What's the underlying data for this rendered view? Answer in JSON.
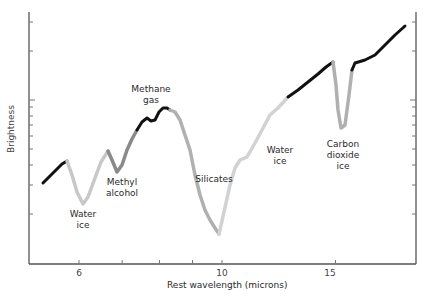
{
  "chart_data": {
    "type": "line",
    "title": "",
    "xlabel": "Rest wavelength (microns)",
    "ylabel": "Brightness",
    "x_scale": "log",
    "y_scale": "log",
    "xlim": [
      5.2,
      19.5
    ],
    "x_ticks": [
      6,
      7,
      8,
      9,
      10,
      15
    ],
    "x_tick_labels": [
      "6",
      "",
      "",
      "",
      "10",
      "15"
    ],
    "grid": false,
    "legend": null,
    "series": [
      {
        "name": "Spectrum",
        "points_px": [
          [
            43,
            183
          ],
          [
            50,
            176
          ],
          [
            56,
            170
          ],
          [
            62,
            164
          ],
          [
            67,
            161
          ],
          [
            72,
            175
          ],
          [
            77,
            192
          ],
          [
            83,
            204
          ],
          [
            88,
            197
          ],
          [
            95,
            178
          ],
          [
            101,
            162
          ],
          [
            108,
            151
          ],
          [
            112,
            160
          ],
          [
            117,
            172
          ],
          [
            122,
            165
          ],
          [
            127,
            150
          ],
          [
            132,
            139
          ],
          [
            137,
            130
          ],
          [
            142,
            122
          ],
          [
            147,
            118
          ],
          [
            151,
            121
          ],
          [
            155,
            120
          ],
          [
            159,
            112
          ],
          [
            163,
            108
          ],
          [
            167,
            108
          ],
          [
            170,
            110
          ],
          [
            175,
            112
          ],
          [
            180,
            120
          ],
          [
            185,
            135
          ],
          [
            190,
            150
          ],
          [
            195,
            175
          ],
          [
            200,
            195
          ],
          [
            205,
            210
          ],
          [
            210,
            220
          ],
          [
            215,
            228
          ],
          [
            219,
            234
          ],
          [
            224,
            212
          ],
          [
            230,
            185
          ],
          [
            235,
            168
          ],
          [
            240,
            160
          ],
          [
            247,
            157
          ],
          [
            255,
            143
          ],
          [
            262,
            130
          ],
          [
            270,
            115
          ],
          [
            278,
            108
          ],
          [
            288,
            97
          ],
          [
            298,
            90
          ],
          [
            308,
            82
          ],
          [
            318,
            74
          ],
          [
            326,
            67
          ],
          [
            333,
            62
          ],
          [
            336,
            85
          ],
          [
            338,
            110
          ],
          [
            341,
            128
          ],
          [
            345,
            125
          ],
          [
            349,
            95
          ],
          [
            352,
            70
          ],
          [
            355,
            63
          ],
          [
            365,
            60
          ],
          [
            375,
            55
          ],
          [
            385,
            45
          ],
          [
            395,
            35
          ],
          [
            405,
            26
          ],
          [
            411,
            20
          ]
        ],
        "segments": [
          {
            "from": 0,
            "to": 4,
            "color": "#111111",
            "feature": ""
          },
          {
            "from": 4,
            "to": 11,
            "color": "#c8c8c8",
            "feature": "Water ice"
          },
          {
            "from": 11,
            "to": 17,
            "color": "#8a8a8a",
            "feature": "Methyl alcohol"
          },
          {
            "from": 17,
            "to": 25,
            "color": "#111111",
            "feature": "Methane gas"
          },
          {
            "from": 25,
            "to": 35,
            "color": "#b0b0b0",
            "feature": "Silicates"
          },
          {
            "from": 35,
            "to": 45,
            "color": "#d2d2d2",
            "feature": "Water ice"
          },
          {
            "from": 45,
            "to": 50,
            "color": "#111111",
            "feature": ""
          },
          {
            "from": 50,
            "to": 56,
            "color": "#b0b0b0",
            "feature": "Carbon dioxide ice"
          },
          {
            "from": 56,
            "to": 62,
            "color": "#111111",
            "feature": ""
          }
        ]
      }
    ],
    "annotations": [
      {
        "text": "Water\nice",
        "x_px": 83,
        "y_px": 215
      },
      {
        "text": "Methyl\nalcohol",
        "x_px": 121,
        "y_px": 181
      },
      {
        "text": "Methane\ngas",
        "x_px": 148,
        "y_px": 85
      },
      {
        "text": "Silicates",
        "x_px": 213,
        "y_px": 177
      },
      {
        "text": "Water\nice",
        "x_px": 280,
        "y_px": 148
      },
      {
        "text": "Carbon\ndioxide\nice",
        "x_px": 342,
        "y_px": 141
      }
    ]
  },
  "labels": {
    "xlabel": "Rest wavelength (microns)",
    "ylabel": "Brightness",
    "ticks": {
      "t6": "6",
      "t10": "10",
      "t15": "15"
    },
    "ann": {
      "water1_a": "Water",
      "water1_b": "ice",
      "methyl_a": "Methyl",
      "methyl_b": "alcohol",
      "methane_a": "Methane",
      "methane_b": "gas",
      "silicates": "Silicates",
      "water2_a": "Water",
      "water2_b": "ice",
      "co2_a": "Carbon",
      "co2_b": "dioxide",
      "co2_c": "ice"
    }
  }
}
